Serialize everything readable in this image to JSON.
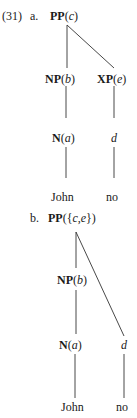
{
  "example": {
    "number": "(31)",
    "a": {
      "marker": "a.",
      "root": {
        "cat": "PP",
        "idx": "c"
      },
      "np": {
        "cat": "NP",
        "idx": "b"
      },
      "xp": {
        "cat": "XP",
        "idx": "e"
      },
      "n": {
        "cat": "N",
        "idx": "a"
      },
      "d": "d",
      "leaf1": "John",
      "leaf2": "no"
    },
    "b": {
      "marker": "b.",
      "root": {
        "cat": "PP",
        "open": "({",
        "idx1": "c",
        "comma": ",",
        "idx2": "e",
        "close": "})"
      },
      "np": {
        "cat": "NP",
        "idx": "b"
      },
      "n": {
        "cat": "N",
        "idx": "a"
      },
      "d": "d",
      "leaf1": "John",
      "leaf2": "no"
    }
  }
}
